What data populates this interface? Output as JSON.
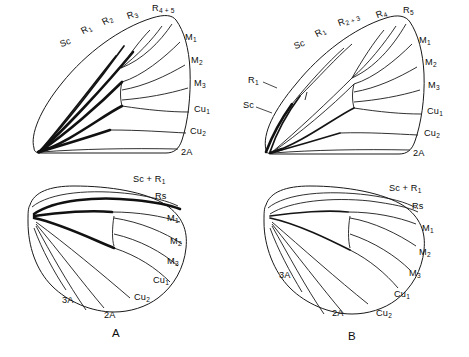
{
  "figure": {
    "type": "scientific-line-drawing",
    "background_color": "#ffffff",
    "ink_color": "#1a1a1a",
    "panels": [
      {
        "id": "A",
        "letter": "A",
        "wings": [
          {
            "id": "A-forewing",
            "position": "top-left",
            "name": "forewing",
            "vein_labels": [
              "Sc",
              "R<sub>1</sub>",
              "R<sub>2</sub>",
              "R<sub>3</sub>",
              "R<sub>4 + 5</sub>",
              "M<sub>1</sub>",
              "M<sub>2</sub>",
              "M<sub>3</sub>",
              "Cu<sub>1</sub>",
              "Cu<sub>2</sub>",
              "2A"
            ]
          },
          {
            "id": "A-hindwing",
            "position": "bottom-left",
            "name": "hindwing",
            "vein_labels": [
              "Sc + R<sub>1</sub>",
              "Rs",
              "M<sub>1</sub>",
              "M<sub>2</sub>",
              "M<sub>3</sub>",
              "Cu<sub>1</sub>",
              "Cu<sub>2</sub>",
              "2A",
              "3A"
            ]
          }
        ]
      },
      {
        "id": "B",
        "letter": "B",
        "wings": [
          {
            "id": "B-forewing",
            "position": "top-right",
            "name": "forewing",
            "vein_labels": [
              "Sc",
              "R<sub>1</sub>",
              "R<sub>2 + 3</sub>",
              "R<sub>4</sub>",
              "R<sub>5</sub>",
              "M<sub>1</sub>",
              "M<sub>2</sub>",
              "M<sub>3</sub>",
              "Cu<sub>1</sub>",
              "Cu<sub>2</sub>",
              "2A",
              "R<sub>1</sub>",
              "Sc"
            ]
          },
          {
            "id": "B-hindwing",
            "position": "bottom-right",
            "name": "hindwing",
            "vein_labels": [
              "Sc + R<sub>1</sub>",
              "Rs",
              "M<sub>1</sub>",
              "M<sub>2</sub>",
              "M<sub>3</sub>",
              "Cu<sub>1</sub>",
              "Cu<sub>2</sub>",
              "2A",
              "3A"
            ]
          }
        ]
      }
    ]
  },
  "labels": {
    "a_fore": {
      "sc": "Sc",
      "r1": "R",
      "r1_sub": "1",
      "r2": "R",
      "r2_sub": "2",
      "r3": "R",
      "r3_sub": "3",
      "r45": "R",
      "r45_sub": "4 + 5",
      "m1": "M",
      "m1_sub": "1",
      "m2": "M",
      "m2_sub": "2",
      "m3": "M",
      "m3_sub": "3",
      "cu1": "Cu",
      "cu1_sub": "1",
      "cu2": "Cu",
      "cu2_sub": "2",
      "a2": "2A"
    },
    "a_hind": {
      "scr1": "Sc + R",
      "scr1_sub": "1",
      "rs": "Rs",
      "m1": "M",
      "m1_sub": "1",
      "m2": "M",
      "m2_sub": "2",
      "m3": "M",
      "m3_sub": "3",
      "cu1": "Cu",
      "cu1_sub": "1",
      "cu2": "Cu",
      "cu2_sub": "2",
      "a2": "2A",
      "a3": "3A"
    },
    "b_fore": {
      "sc_top": "Sc",
      "r1_top": "R",
      "r1_top_sub": "1",
      "r23": "R",
      "r23_sub": "2 + 3",
      "r4": "R",
      "r4_sub": "4",
      "r5": "R",
      "r5_sub": "5",
      "m1": "M",
      "m1_sub": "1",
      "m2": "M",
      "m2_sub": "2",
      "m3": "M",
      "m3_sub": "3",
      "cu1": "Cu",
      "cu1_sub": "1",
      "cu2": "Cu",
      "cu2_sub": "2",
      "a2": "2A",
      "r1_base": "R",
      "r1_base_sub": "1",
      "sc_base": "Sc"
    },
    "b_hind": {
      "scr1": "Sc + R",
      "scr1_sub": "1",
      "rs": "Rs",
      "m1": "M",
      "m1_sub": "1",
      "m2": "M",
      "m2_sub": "2",
      "m3": "M",
      "m3_sub": "3",
      "cu1": "Cu",
      "cu1_sub": "1",
      "cu2": "Cu",
      "cu2_sub": "2",
      "a2": "2A",
      "a3": "3A"
    },
    "panel_a": "A",
    "panel_b": "B"
  }
}
